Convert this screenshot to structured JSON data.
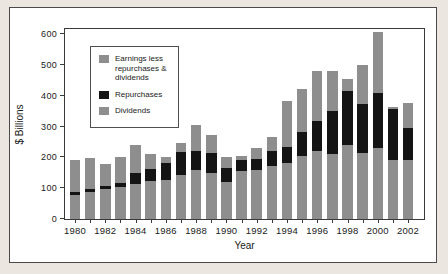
{
  "figure": {
    "background": "#ffffff",
    "page_background": "#ebe7e0",
    "border_color": "#4a4a4a"
  },
  "chart_data": {
    "type": "bar",
    "subtype": "stacked",
    "title": "",
    "xlabel": "Year",
    "ylabel": "$ Billions",
    "ylim": [
      0,
      616
    ],
    "yticks": [
      0,
      100,
      200,
      300,
      400,
      500,
      600
    ],
    "grid": "off",
    "categories": [
      1980,
      1981,
      1982,
      1983,
      1984,
      1985,
      1986,
      1987,
      1988,
      1989,
      1990,
      1991,
      1992,
      1993,
      1994,
      1995,
      1996,
      1997,
      1998,
      1999,
      2000,
      2001,
      2002
    ],
    "x_tick_labels": [
      "1980",
      "1982",
      "1984",
      "1986",
      "1988",
      "1990",
      "1992",
      "1994",
      "1996",
      "1998",
      "2000",
      "2002"
    ],
    "series": [
      {
        "name": "Dividends",
        "color": "#8e8e8e",
        "values": [
          78,
          88,
          96,
          105,
          114,
          122,
          126,
          142,
          158,
          150,
          120,
          157,
          160,
          173,
          182,
          205,
          221,
          210,
          240,
          214,
          232,
          190,
          190
        ]
      },
      {
        "name": "Repurchases",
        "color": "#141414",
        "values": [
          10,
          8,
          12,
          13,
          34,
          40,
          57,
          76,
          64,
          65,
          46,
          34,
          36,
          48,
          53,
          78,
          98,
          140,
          176,
          158,
          176,
          168,
          107
        ]
      },
      {
        "name": "Earnings less repurchases & dividends",
        "color": "#8e8e8e",
        "values": [
          105,
          102,
          70,
          82,
          92,
          49,
          17,
          28,
          83,
          57,
          34,
          13,
          34,
          46,
          147,
          139,
          161,
          132,
          39,
          128,
          200,
          6,
          81
        ]
      }
    ],
    "totals": [
      193,
      198,
      178,
      200,
      240,
      211,
      200,
      246,
      305,
      272,
      200,
      204,
      230,
      267,
      382,
      422,
      480,
      482,
      455,
      500,
      608,
      364,
      378
    ],
    "legend_position": "upper-left-inside",
    "legend": [
      {
        "label": "Earnings less repurchases & dividends",
        "color": "#8e8e8e"
      },
      {
        "label": "Repurchases",
        "color": "#141414"
      },
      {
        "label": "Dividends",
        "color": "#8e8e8e"
      }
    ],
    "axis_color": "#3a3a3a"
  }
}
